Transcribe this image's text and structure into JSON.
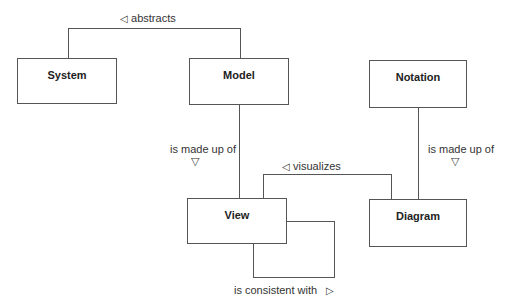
{
  "diagram": {
    "boxes": {
      "system": {
        "title": "System"
      },
      "model": {
        "title": "Model"
      },
      "notation": {
        "title": "Notation"
      },
      "view": {
        "title": "View"
      },
      "diagram": {
        "title": "Diagram"
      }
    },
    "relations": {
      "abstracts": {
        "label": "abstracts",
        "arrow": "◁"
      },
      "model_made_up_of": {
        "label": "is made up of",
        "arrow": "▽"
      },
      "notation_made_up_of": {
        "label": "is made up of",
        "arrow": "▽"
      },
      "visualizes": {
        "label": "visualizes",
        "arrow": "◁"
      },
      "consistent_with": {
        "label": "is consistent with",
        "arrow": "▷"
      }
    }
  }
}
